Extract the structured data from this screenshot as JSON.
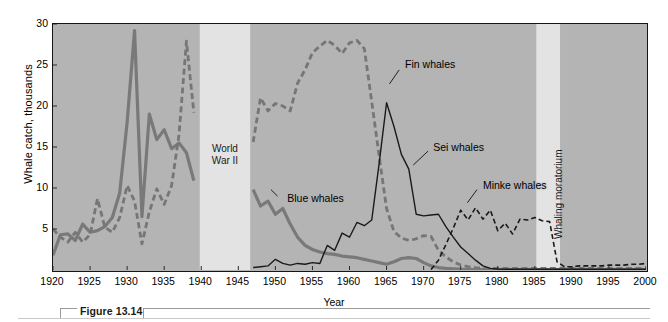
{
  "figure": {
    "caption_number": "Figure 13.14"
  },
  "chart_data": {
    "type": "line",
    "title": "",
    "xlabel": "Year",
    "ylabel": "Whale catch, thousands",
    "xlim": [
      1920,
      2000
    ],
    "ylim": [
      0,
      30
    ],
    "xticks": [
      1920,
      1925,
      1930,
      1935,
      1940,
      1945,
      1950,
      1955,
      1960,
      1965,
      1970,
      1975,
      1980,
      1985,
      1990,
      1995,
      2000
    ],
    "yticks": [
      5,
      10,
      15,
      20,
      25,
      30
    ],
    "grid": false,
    "legend_position": "inline-annotations",
    "plot_background": "#b4b4b4",
    "bands": [
      {
        "name": "World War II",
        "label": "World\nWar II",
        "label_line1": "World",
        "label_line2": "War II",
        "start": 1939.8,
        "end": 1946.6,
        "color": "#e3e3e3",
        "orientation": "horizontal"
      },
      {
        "name": "Whaling moratorium",
        "label": "Whaling moratorium",
        "start": 1985.2,
        "end": 1988.4,
        "color": "#e3e3e3",
        "orientation": "vertical"
      }
    ],
    "series": [
      {
        "name": "Blue whales",
        "color": "#797979",
        "style": "solid",
        "width": 3.2,
        "label_x": 1951.6,
        "label_y": 8.6,
        "leader_from_x": 1950.3,
        "leader_from_y": 9.0,
        "leader_to_x": 1949.4,
        "leader_to_y": 9.8,
        "x": [
          1920,
          1921,
          1922,
          1923,
          1924,
          1925,
          1926,
          1927,
          1928,
          1929,
          1930,
          1931,
          1932,
          1933,
          1934,
          1935,
          1936,
          1937,
          1938,
          1939,
          1947,
          1948,
          1949,
          1950,
          1951,
          1952,
          1953,
          1954,
          1955,
          1956,
          1957,
          1958,
          1959,
          1960,
          1961,
          1962,
          1963,
          1964,
          1965,
          1966,
          1967,
          1968,
          1969,
          1970,
          1971,
          1972,
          1973,
          1974,
          1975,
          1976,
          1977,
          1978,
          1979,
          1980,
          1981,
          1982,
          1983,
          1984,
          1985,
          1986,
          1987,
          1988,
          1989,
          1990,
          1991,
          1992,
          1993,
          1994,
          1995,
          1996,
          1997,
          1998,
          1999,
          2000
        ],
        "y": [
          1.8,
          4.3,
          4.4,
          3.6,
          5.6,
          4.6,
          4.8,
          5.3,
          6.4,
          9.4,
          18.0,
          29.2,
          6.5,
          19.0,
          15.9,
          17.1,
          14.8,
          15.5,
          14.3,
          10.9,
          9.8,
          7.8,
          8.4,
          6.8,
          7.5,
          5.6,
          4.0,
          3.0,
          2.5,
          2.2,
          2.0,
          1.9,
          1.7,
          1.6,
          1.5,
          1.3,
          1.1,
          0.9,
          0.7,
          1.0,
          1.4,
          1.5,
          1.4,
          0.9,
          0.5,
          0.3,
          0.2,
          0.15,
          0.1,
          0.08,
          0.06,
          0.05,
          0.05,
          0.05,
          0.05,
          0.05,
          0.05,
          0.05,
          0.05,
          0.05,
          0.05,
          0.05,
          0.05,
          0.05,
          0.05,
          0.05,
          0.05,
          0.05,
          0.05,
          0.05,
          0.05,
          0.05,
          0.05,
          0.05
        ]
      },
      {
        "name": "Fin whales",
        "color": "#767676",
        "style": "dashed",
        "width": 2.8,
        "label_x": 1967.5,
        "label_y": 25.0,
        "leader_from_x": 1966.7,
        "leader_from_y": 24.4,
        "leader_to_x": 1965.4,
        "leader_to_y": 22.7,
        "x": [
          1920,
          1921,
          1922,
          1923,
          1924,
          1925,
          1926,
          1927,
          1928,
          1929,
          1930,
          1931,
          1932,
          1933,
          1934,
          1935,
          1936,
          1937,
          1938,
          1939,
          1947,
          1948,
          1949,
          1950,
          1951,
          1952,
          1953,
          1954,
          1955,
          1956,
          1957,
          1958,
          1959,
          1960,
          1961,
          1962,
          1963,
          1964,
          1965,
          1966,
          1967,
          1968,
          1969,
          1970,
          1971,
          1972,
          1973,
          1974,
          1975,
          1976,
          1977,
          1978,
          1979,
          1980,
          1981,
          1982,
          1983,
          1984,
          1985,
          1986,
          1987,
          1988,
          1989,
          1990,
          1991,
          1992,
          1993,
          1994,
          1995,
          1996,
          1997,
          1998,
          1999,
          2000
        ],
        "y": [
          5.0,
          4.0,
          3.4,
          4.6,
          3.4,
          4.3,
          8.7,
          5.2,
          4.6,
          6.4,
          10.3,
          8.4,
          3.2,
          7.1,
          9.9,
          8.0,
          10.3,
          16.5,
          27.9,
          19.2,
          15.6,
          21.0,
          19.4,
          20.3,
          20.0,
          19.4,
          22.8,
          24.4,
          26.5,
          27.3,
          28.0,
          27.4,
          26.4,
          27.7,
          28.0,
          27.0,
          20.5,
          13.9,
          7.5,
          4.7,
          3.9,
          3.6,
          3.8,
          4.2,
          4.1,
          2.4,
          1.6,
          1.0,
          0.6,
          0.4,
          0.3,
          0.25,
          0.2,
          0.2,
          0.2,
          0.2,
          0.2,
          0.2,
          0.2,
          0.2,
          0.2,
          0.2,
          0.2,
          0.2,
          0.2,
          0.2,
          0.2,
          0.2,
          0.2,
          0.2,
          0.2,
          0.2,
          0.2,
          0.2
        ]
      },
      {
        "name": "Sei whales",
        "color": "#1a1a1a",
        "style": "solid",
        "width": 1.4,
        "label_x": 1971.3,
        "label_y": 14.9,
        "leader_from_x": 1970.6,
        "leader_from_y": 14.5,
        "leader_to_x": 1968.6,
        "leader_to_y": 12.8,
        "x": [
          1947,
          1948,
          1949,
          1950,
          1951,
          1952,
          1953,
          1954,
          1955,
          1956,
          1957,
          1958,
          1959,
          1960,
          1961,
          1962,
          1963,
          1964,
          1965,
          1966,
          1967,
          1968,
          1969,
          1970,
          1971,
          1972,
          1973,
          1974,
          1975,
          1976,
          1977,
          1978,
          1979,
          1980,
          1981,
          1982,
          1983,
          1984,
          1985,
          1986,
          1987,
          1988,
          1989,
          1990,
          1991,
          1992,
          1993,
          1994,
          1995,
          1996,
          1997,
          1998,
          1999,
          2000
        ],
        "y": [
          0.3,
          0.4,
          0.5,
          1.3,
          0.8,
          0.6,
          0.8,
          0.7,
          0.9,
          0.8,
          3.0,
          2.4,
          4.5,
          4.0,
          5.8,
          5.4,
          6.1,
          13.0,
          20.4,
          17.5,
          14.1,
          12.3,
          6.8,
          6.6,
          6.7,
          6.8,
          5.3,
          4.0,
          2.8,
          2.0,
          1.2,
          0.5,
          0.2,
          0.12,
          0.1,
          0.1,
          0.1,
          0.1,
          0.1,
          0.1,
          0.1,
          0.1,
          0.1,
          0.1,
          0.1,
          0.1,
          0.1,
          0.1,
          0.1,
          0.1,
          0.1,
          0.1,
          0.1,
          0.1
        ]
      },
      {
        "name": "Minke whales",
        "color": "#1a1a1a",
        "style": "dashed",
        "width": 1.6,
        "label_x": 1978.0,
        "label_y": 10.3,
        "leader_from_x": 1977.2,
        "leader_from_y": 9.8,
        "leader_to_x": 1975.9,
        "leader_to_y": 8.2,
        "x": [
          1971,
          1972,
          1973,
          1974,
          1975,
          1976,
          1977,
          1978,
          1979,
          1980,
          1981,
          1982,
          1983,
          1984,
          1985,
          1986,
          1987,
          1988,
          1989,
          1990,
          1991,
          1992,
          1993,
          1994,
          1995,
          1996,
          1997,
          1998,
          1999,
          2000
        ],
        "y": [
          0.05,
          1.2,
          3.1,
          5.1,
          7.3,
          6.1,
          7.6,
          6.2,
          7.3,
          4.8,
          5.7,
          4.4,
          6.2,
          6.1,
          6.4,
          6.0,
          5.9,
          1.0,
          0.4,
          0.4,
          0.5,
          0.5,
          0.5,
          0.5,
          0.6,
          0.6,
          0.6,
          0.7,
          0.7,
          0.8
        ]
      }
    ]
  }
}
